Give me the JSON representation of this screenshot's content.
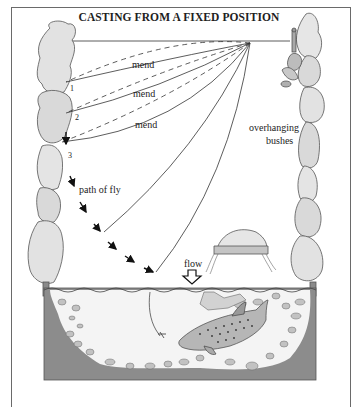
{
  "title": "CASTING FROM A FIXED POSITION",
  "labels": {
    "mend_1": "mend",
    "mend_2": "mend",
    "mend_3": "mend",
    "overhanging_line1": "overhanging",
    "overhanging_line2": "bushes",
    "path_of_fly": "path of fly",
    "flow": "flow"
  },
  "positions": {
    "p1": "1",
    "p2": "2",
    "p3": "3"
  },
  "icons": [
    "tree-bush",
    "angler-figure",
    "flow-arrow",
    "trout",
    "rock",
    "fly",
    "path-arrow"
  ],
  "colors": {
    "bush_fill": "#d9d9d9",
    "bush_stroke": "#555555",
    "water_bg": "#f4f4f4",
    "bank_dark": "#7a7a7a",
    "rock_fill": "#bdbdbd",
    "line": "#333333"
  }
}
